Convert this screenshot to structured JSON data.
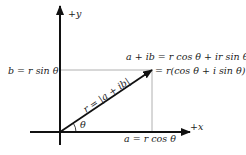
{
  "diagram": {
    "type": "complex-plane-polar-form",
    "axes": {
      "y_label": "+y",
      "x_label": "+x"
    },
    "labels": {
      "b_projection": "b = r sin θ",
      "a_projection": "a = r cos θ",
      "modulus": "r = |a + ib|",
      "angle": "θ",
      "point_line1": "a + ib = r cos θ + ir sin θ",
      "point_line2": "= r(cos θ + i sin θ)"
    },
    "colors": {
      "axis": "#111111",
      "vector": "#111111",
      "guide": "#b0b0b0",
      "text": "#222222"
    }
  }
}
